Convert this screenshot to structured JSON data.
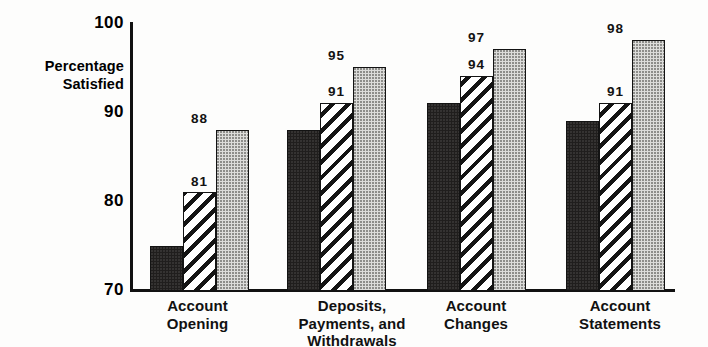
{
  "chart_data": {
    "type": "bar",
    "title": "",
    "subtitle": "",
    "xlabel": "",
    "ylabel": "Percentage Satisfied",
    "ylabel_lines": [
      "Percentage",
      "Satisfied"
    ],
    "ylim": [
      70,
      100
    ],
    "yticks": [
      70,
      80,
      90,
      100
    ],
    "ytick_labels": [
      "70",
      "80",
      "90",
      "100"
    ],
    "grid": false,
    "legend": "none",
    "categories": [
      "Account Opening",
      "Deposits, Payments, and Withdrawals",
      "Account Changes",
      "Account Statements"
    ],
    "category_label_lines": [
      [
        "Account",
        "Opening"
      ],
      [
        "Deposits,",
        "Payments, and",
        "Withdrawals"
      ],
      [
        "Account",
        "Changes"
      ],
      [
        "Account",
        "Statements"
      ]
    ],
    "series": [
      {
        "name": "series-1",
        "fill": "solid-dark",
        "color": "#201e1d",
        "values": [
          75,
          88,
          91,
          89
        ]
      },
      {
        "name": "series-2",
        "fill": "diagonal-hatch",
        "color": "#ffffff",
        "values": [
          81,
          91,
          94,
          91
        ]
      },
      {
        "name": "series-3",
        "fill": "light-stipple",
        "color": "#dcdcda",
        "values": [
          88,
          95,
          97,
          98
        ]
      }
    ],
    "bar_labels": [
      [
        "75",
        "81",
        "88"
      ],
      [
        "88",
        "91",
        "95"
      ],
      [
        "91",
        "94",
        "97"
      ],
      [
        "89",
        "91",
        "98"
      ]
    ]
  },
  "axis": {
    "tick_100": "100",
    "tick_90": "90",
    "tick_80": "80",
    "tick_70": "70",
    "title_line1": "Percentage",
    "title_line2": "Satisfied"
  },
  "groups": [
    {
      "line1": "Account",
      "line2": "Opening",
      "line3": "",
      "bars": [
        {
          "value": 75,
          "label": "75"
        },
        {
          "value": 81,
          "label": "81"
        },
        {
          "value": 88,
          "label": "88"
        }
      ]
    },
    {
      "line1": "Deposits,",
      "line2": "Payments, and",
      "line3": "Withdrawals",
      "bars": [
        {
          "value": 88,
          "label": "88"
        },
        {
          "value": 91,
          "label": "91"
        },
        {
          "value": 95,
          "label": "95"
        }
      ]
    },
    {
      "line1": "Account",
      "line2": "Changes",
      "line3": "",
      "bars": [
        {
          "value": 91,
          "label": "91"
        },
        {
          "value": 94,
          "label": "94"
        },
        {
          "value": 97,
          "label": "97"
        }
      ]
    },
    {
      "line1": "Account",
      "line2": "Statements",
      "line3": "",
      "bars": [
        {
          "value": 89,
          "label": "89"
        },
        {
          "value": 91,
          "label": "91"
        },
        {
          "value": 98,
          "label": "98"
        }
      ]
    }
  ],
  "colors": {
    "ink": "#111111",
    "series1": "#201e1d",
    "series2": "#ffffff",
    "series3": "#dcdcda",
    "background": "#fdfdfc"
  }
}
